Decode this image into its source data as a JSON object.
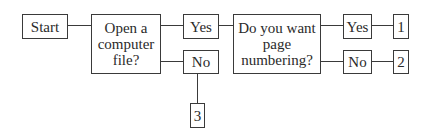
{
  "diagram": {
    "type": "flowchart",
    "nodes": {
      "start": "Start",
      "q1": "Open a computer file?",
      "q1_yes": "Yes",
      "q1_no": "No",
      "out3": "3",
      "q2": "Do you want page numbering?",
      "q2_yes": "Yes",
      "q2_no": "No",
      "out1": "1",
      "out2": "2"
    },
    "edges": [
      [
        "start",
        "q1"
      ],
      [
        "q1",
        "q1_yes"
      ],
      [
        "q1",
        "q1_no"
      ],
      [
        "q1_yes",
        "q2"
      ],
      [
        "q1_no",
        "out3"
      ],
      [
        "q2",
        "q2_yes"
      ],
      [
        "q2",
        "q2_no"
      ],
      [
        "q2_yes",
        "out1"
      ],
      [
        "q2_no",
        "out2"
      ]
    ]
  }
}
